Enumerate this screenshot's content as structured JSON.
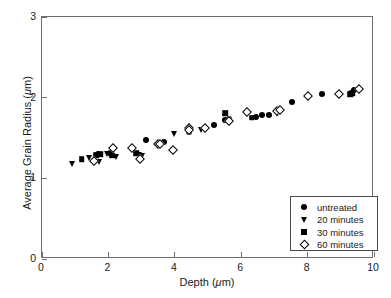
{
  "chart_data": {
    "type": "scatter",
    "title": "",
    "xlabel": "Depth (μm)",
    "ylabel": "Average Grain Radius (μm)",
    "xlim": [
      0,
      10
    ],
    "ylim": [
      0,
      3
    ],
    "xticks": [
      0,
      2,
      4,
      6,
      8,
      10
    ],
    "yticks": [
      0,
      1,
      2,
      3
    ],
    "xtick_labels": [
      "0",
      "2",
      "4",
      "6",
      "8",
      "10"
    ],
    "ytick_labels": [
      "0",
      "1",
      "2",
      "3"
    ],
    "grid": false,
    "legend_position": "lower-right",
    "series": [
      {
        "name": "untreated",
        "marker": "filled-circle",
        "color": "#000000",
        "points": [
          [
            1.7,
            1.3
          ],
          [
            3.12,
            1.47
          ],
          [
            3.68,
            1.45
          ],
          [
            4.42,
            1.58
          ],
          [
            5.18,
            1.66
          ],
          [
            5.52,
            1.72
          ],
          [
            5.62,
            1.73
          ],
          [
            6.46,
            1.76
          ],
          [
            6.62,
            1.78
          ],
          [
            6.84,
            1.79
          ],
          [
            7.52,
            1.95
          ],
          [
            8.44,
            2.04
          ],
          [
            9.32,
            2.06
          ],
          [
            9.4,
            2.1
          ]
        ]
      },
      {
        "name": "20 minutes",
        "marker": "filled-triangle-down",
        "color": "#000000",
        "points": [
          [
            0.9,
            1.18
          ],
          [
            1.42,
            1.25
          ],
          [
            1.72,
            1.2
          ],
          [
            1.96,
            1.3
          ],
          [
            2.24,
            1.26
          ],
          [
            2.92,
            1.29
          ],
          [
            3.0,
            1.28
          ],
          [
            3.98,
            1.55
          ],
          [
            4.8,
            1.6
          ],
          [
            5.56,
            1.71
          ],
          [
            7.08,
            1.8
          ]
        ]
      },
      {
        "name": "30 minutes",
        "marker": "filled-square",
        "color": "#000000",
        "points": [
          [
            1.2,
            1.24
          ],
          [
            1.64,
            1.29
          ],
          [
            1.76,
            1.3
          ],
          [
            2.08,
            1.31
          ],
          [
            2.12,
            1.28
          ],
          [
            2.84,
            1.31
          ],
          [
            5.52,
            1.81
          ],
          [
            6.32,
            1.75
          ],
          [
            9.28,
            2.04
          ],
          [
            9.36,
            2.05
          ]
        ]
      },
      {
        "name": "60 minutes",
        "marker": "open-diamond",
        "color": "#000000",
        "points": [
          [
            1.56,
            1.22
          ],
          [
            2.14,
            1.37
          ],
          [
            2.7,
            1.38
          ],
          [
            2.96,
            1.24
          ],
          [
            3.48,
            1.43
          ],
          [
            3.56,
            1.42
          ],
          [
            3.94,
            1.35
          ],
          [
            4.42,
            1.62
          ],
          [
            4.44,
            1.6
          ],
          [
            4.92,
            1.62
          ],
          [
            5.62,
            1.71
          ],
          [
            6.18,
            1.82
          ],
          [
            7.08,
            1.84
          ],
          [
            7.16,
            1.85
          ],
          [
            8.0,
            2.02
          ],
          [
            8.96,
            2.05
          ],
          [
            9.54,
            2.11
          ]
        ]
      }
    ]
  },
  "legend": {
    "entries": [
      {
        "label": "untreated",
        "marker": "filled-circle"
      },
      {
        "label": "20 minutes",
        "marker": "filled-triangle-down"
      },
      {
        "label": "30 minutes",
        "marker": "filled-square"
      },
      {
        "label": "60 minutes",
        "marker": "open-diamond"
      }
    ]
  }
}
